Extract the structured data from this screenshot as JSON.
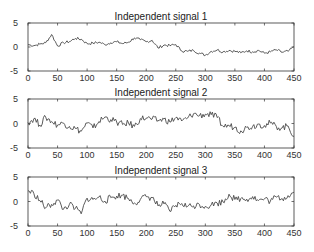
{
  "chart_data": [
    {
      "type": "line",
      "title": "Independent signal 1",
      "xlabel": "",
      "ylabel": "",
      "xlim": [
        0,
        450
      ],
      "ylim": [
        -5,
        5
      ],
      "xticks": [
        0,
        50,
        100,
        150,
        200,
        250,
        300,
        350,
        400,
        450
      ],
      "yticks": [
        -5,
        0,
        5
      ],
      "grid": false,
      "x": [
        0,
        10,
        20,
        30,
        40,
        50,
        60,
        70,
        80,
        90,
        100,
        110,
        120,
        130,
        140,
        150,
        160,
        170,
        180,
        190,
        200,
        210,
        220,
        230,
        240,
        250,
        260,
        270,
        280,
        290,
        300,
        310,
        320,
        330,
        340,
        350,
        360,
        370,
        380,
        390,
        400,
        410,
        420,
        430,
        440,
        450
      ],
      "series": [
        {
          "name": "signal 1",
          "values": [
            0.5,
            0.3,
            0.6,
            0.9,
            2.6,
            0.2,
            0.9,
            1.1,
            1.8,
            1.6,
            0.7,
            0.8,
            1.0,
            0.5,
            0.9,
            1.1,
            0.7,
            1.0,
            1.9,
            1.5,
            1.1,
            1.4,
            -0.2,
            0.4,
            0.3,
            0.5,
            -0.8,
            -0.9,
            -0.7,
            -1.3,
            -1.7,
            -0.9,
            -0.6,
            -1.0,
            -0.7,
            -0.9,
            -1.2,
            -0.8,
            -1.0,
            -0.7,
            -1.3,
            -1.0,
            -0.6,
            -1.1,
            -0.9,
            0.0
          ]
        }
      ]
    },
    {
      "type": "line",
      "title": "Independent signal 2",
      "xlabel": "",
      "ylabel": "",
      "xlim": [
        0,
        450
      ],
      "ylim": [
        -5,
        5
      ],
      "xticks": [
        0,
        50,
        100,
        150,
        200,
        250,
        300,
        350,
        400,
        450
      ],
      "yticks": [
        -5,
        0,
        5
      ],
      "grid": false,
      "x": [
        0,
        10,
        20,
        30,
        40,
        50,
        60,
        70,
        80,
        90,
        100,
        110,
        120,
        130,
        140,
        150,
        160,
        170,
        180,
        190,
        200,
        210,
        220,
        230,
        240,
        250,
        260,
        270,
        280,
        290,
        300,
        310,
        320,
        330,
        340,
        350,
        360,
        370,
        380,
        390,
        400,
        410,
        420,
        430,
        440,
        450
      ],
      "series": [
        {
          "name": "signal 2",
          "values": [
            0.2,
            1.0,
            -0.3,
            1.3,
            0.4,
            -0.3,
            0.1,
            -0.6,
            -1.0,
            -1.6,
            0.1,
            -0.9,
            0.4,
            1.3,
            0.8,
            0.3,
            -0.2,
            0.1,
            -0.6,
            1.0,
            1.1,
            0.9,
            0.6,
            0.9,
            0.3,
            1.2,
            0.5,
            1.1,
            2.0,
            1.6,
            1.9,
            1.8,
            1.2,
            -0.6,
            -0.4,
            -0.8,
            -1.5,
            -0.8,
            -0.6,
            -0.1,
            -0.4,
            0.1,
            -0.6,
            -0.9,
            -0.5,
            -2.6
          ]
        }
      ]
    },
    {
      "type": "line",
      "title": "Independent signal 3",
      "xlabel": "",
      "ylabel": "",
      "xlim": [
        0,
        450
      ],
      "ylim": [
        -5,
        5
      ],
      "xticks": [
        0,
        50,
        100,
        150,
        200,
        250,
        300,
        350,
        400,
        450
      ],
      "yticks": [
        -5,
        0,
        5
      ],
      "grid": false,
      "x": [
        0,
        10,
        20,
        30,
        40,
        50,
        60,
        70,
        80,
        90,
        100,
        110,
        120,
        130,
        140,
        150,
        160,
        170,
        180,
        190,
        200,
        210,
        220,
        230,
        240,
        250,
        260,
        270,
        280,
        290,
        300,
        310,
        320,
        330,
        340,
        350,
        360,
        370,
        380,
        390,
        400,
        410,
        420,
        430,
        440,
        450
      ],
      "series": [
        {
          "name": "signal 3",
          "values": [
            2.2,
            1.6,
            0.2,
            -1.3,
            -0.6,
            0.3,
            -1.6,
            -0.6,
            -1.4,
            -2.5,
            0.7,
            0.4,
            0.9,
            0.1,
            0.8,
            1.1,
            1.3,
            0.6,
            -0.3,
            0.4,
            1.0,
            0.8,
            -0.9,
            -0.5,
            -2.0,
            -0.8,
            -0.4,
            -1.0,
            -0.9,
            -0.6,
            -1.0,
            -0.7,
            -0.3,
            -0.1,
            1.5,
            0.4,
            0.6,
            0.5,
            1.0,
            0.2,
            0.5,
            0.1,
            0.9,
            0.6,
            1.2,
            1.9
          ]
        }
      ]
    }
  ]
}
